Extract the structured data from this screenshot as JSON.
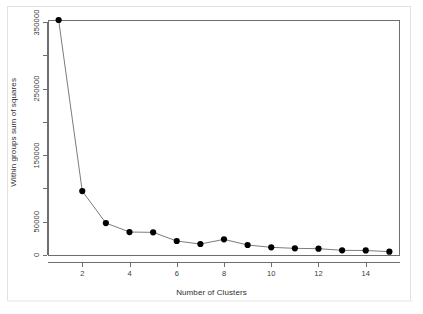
{
  "figure": {
    "background_color": "#ffffff",
    "frame_color": "#6e6e72",
    "card_border_color": "#e3e3e5"
  },
  "chart_data": {
    "type": "line",
    "title": "",
    "subtitle": "",
    "xlabel": "Number of Clusters",
    "ylabel": "Within groups sum of squares",
    "x": [
      1,
      2,
      3,
      4,
      5,
      6,
      7,
      8,
      9,
      10,
      11,
      12,
      13,
      14,
      15
    ],
    "values": [
      353000,
      96000,
      48000,
      34500,
      34000,
      21000,
      16500,
      23500,
      15000,
      11500,
      10000,
      9500,
      7000,
      6800,
      5000
    ],
    "series": [
      {
        "name": "Within groups sum of squares",
        "values": [
          353000,
          96000,
          48000,
          34500,
          34000,
          21000,
          16500,
          23500,
          15000,
          11500,
          10000,
          9500,
          7000,
          6800,
          5000
        ]
      }
    ],
    "xlim": [
      0.55,
      15.45
    ],
    "ylim": [
      0,
      358000
    ],
    "xticks": [
      2,
      4,
      6,
      8,
      10,
      12,
      14
    ],
    "xtick_labels": [
      "2",
      "4",
      "6",
      "8",
      "10",
      "12",
      "14"
    ],
    "yticks": [
      0,
      50000,
      100000,
      150000,
      200000,
      250000,
      300000,
      350000
    ],
    "ytick_labels": [
      "0",
      "50000",
      "",
      "150000",
      "",
      "250000",
      "",
      "350000"
    ],
    "grid": false,
    "legend": false,
    "legend_position": "none",
    "marker": "filled-circle",
    "marker_color": "#000000",
    "line_color": "#5a5a5e",
    "line_width": 0.8,
    "marker_size": 3.1,
    "annotations": []
  }
}
